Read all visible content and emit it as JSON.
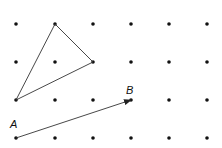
{
  "diagram": {
    "type": "dot-grid-geometry",
    "grid": {
      "columns_x": [
        16,
        55,
        93,
        131,
        169,
        207
      ],
      "rows_y": [
        24,
        62,
        100,
        138
      ],
      "dot_radius": 1.8,
      "dot_color": "#111111"
    },
    "triangle": {
      "vertices": [
        [
          55,
          24
        ],
        [
          93,
          62
        ],
        [
          16,
          100
        ]
      ],
      "stroke": "#333333"
    },
    "vector": {
      "from": [
        16,
        138
      ],
      "to": [
        131,
        100
      ],
      "stroke": "#333333",
      "start_label": "A",
      "end_label": "B"
    }
  }
}
